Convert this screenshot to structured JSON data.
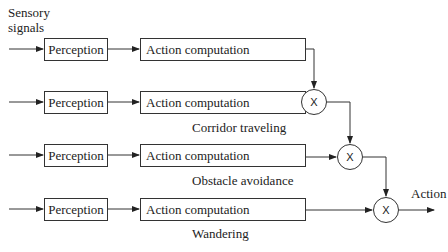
{
  "input_label": "Sensory\nsignals",
  "input_label_lines": [
    "Sensory",
    "signals"
  ],
  "rows": [
    {
      "perception": "Perception",
      "action": "Action computation",
      "behavior": ""
    },
    {
      "perception": "Perception",
      "action": "Action computation",
      "behavior": "Corridor traveling"
    },
    {
      "perception": "Perception",
      "action": "Action computation",
      "behavior": "Obstacle avoidance"
    },
    {
      "perception": "Perception",
      "action": "Action computation",
      "behavior": "Wandering"
    }
  ],
  "multipliers": [
    "X",
    "X",
    "X"
  ],
  "output_label": "Action"
}
